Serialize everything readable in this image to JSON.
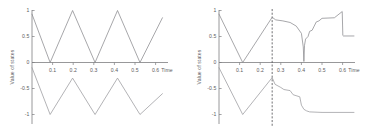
{
  "figure": {
    "title": "",
    "background": "#ffffff",
    "trace_color": "#8a8a8d",
    "axis_color": "#7d7d80",
    "event_line_color": "#4e4e50"
  },
  "panels": [
    {
      "id": "left",
      "ylabel": "Value of states",
      "xlabel": "Time",
      "yticks": [
        "1",
        "0.5",
        "0",
        "-0.5",
        "-1"
      ],
      "xticks": [
        "0.1",
        "0.2",
        "0.3",
        "0.4",
        "0.5",
        "0.6"
      ]
    },
    {
      "id": "right",
      "ylabel": "Value of states",
      "xlabel": "Time",
      "yticks": [
        "1",
        "0.5",
        "0",
        "-0.5",
        "-1"
      ],
      "xticks": [
        "0.1",
        "0.2",
        "0.3",
        "0.4",
        "0.5",
        "0.6"
      ]
    }
  ],
  "chart_data": [
    {
      "type": "line",
      "panel": "left",
      "title": "",
      "xlabel": "Time",
      "ylabel": "Value of states",
      "xlim": [
        0,
        0.66
      ],
      "ylim": [
        -1,
        1
      ],
      "xticks": [
        0.1,
        0.2,
        0.3,
        0.4,
        0.5,
        0.6
      ],
      "yticks": [
        -1,
        -0.5,
        0,
        0.5,
        1
      ],
      "grid": false,
      "legend": "none",
      "description": "Two mirrored triangular-wave states oscillating undamped between +1 and -1 with a period of about 0.215 s.",
      "series": [
        {
          "name": "state-1",
          "x": [
            0.0,
            0.088,
            0.197,
            0.306,
            0.415,
            0.524,
            0.633
          ],
          "y": [
            0.93,
            0.0,
            1.0,
            0.0,
            1.0,
            0.0,
            0.86
          ]
        },
        {
          "name": "state-2",
          "x": [
            0.0,
            0.088,
            0.197,
            0.306,
            0.415,
            0.524,
            0.633
          ],
          "y": [
            -0.1,
            -1.0,
            -0.3,
            -1.0,
            -0.3,
            -1.0,
            -0.6
          ]
        }
      ]
    },
    {
      "type": "line",
      "panel": "right",
      "title": "",
      "xlabel": "Time",
      "ylabel": "Value of states",
      "xlim": [
        0,
        0.66
      ],
      "ylim": [
        -1,
        1
      ],
      "xticks": [
        0.1,
        0.2,
        0.3,
        0.4,
        0.5,
        0.6
      ],
      "yticks": [
        -1,
        -0.5,
        0,
        0.5,
        1
      ],
      "grid": false,
      "legend": "none",
      "event_line_x": 0.258,
      "description": "Same triangular oscillation until a dashed vertical event line at t = 0.258 s; afterwards the upper state decays and settles in staircase steps while the lower state drops in steps toward -1.",
      "series": [
        {
          "name": "state-1",
          "x": [
            0.0,
            0.115,
            0.258,
            0.275,
            0.31,
            0.345,
            0.375,
            0.4,
            0.409,
            0.412,
            0.415,
            0.42,
            0.432,
            0.44,
            0.452,
            0.462,
            0.472,
            0.485,
            0.5,
            0.56,
            0.598,
            0.601,
            0.604,
            0.655
          ],
          "y": [
            0.93,
            0.0,
            0.87,
            0.82,
            0.8,
            0.77,
            0.7,
            0.56,
            0.3,
            0.02,
            0.33,
            0.45,
            0.5,
            0.6,
            0.62,
            0.7,
            0.78,
            0.8,
            0.85,
            0.86,
            0.98,
            0.52,
            0.51,
            0.51
          ]
        },
        {
          "name": "state-2",
          "x": [
            0.0,
            0.115,
            0.258,
            0.272,
            0.3,
            0.315,
            0.345,
            0.36,
            0.392,
            0.4,
            0.412,
            0.425,
            0.44,
            0.5,
            0.655
          ],
          "y": [
            -0.1,
            -1.0,
            -0.29,
            -0.42,
            -0.48,
            -0.52,
            -0.54,
            -0.62,
            -0.66,
            -0.82,
            -0.9,
            -0.93,
            -0.95,
            -0.96,
            -0.96
          ]
        }
      ]
    }
  ]
}
